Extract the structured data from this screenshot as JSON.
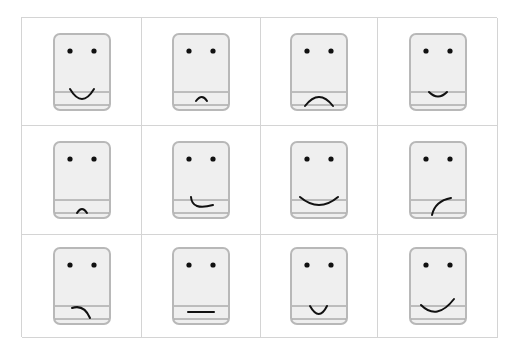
{
  "grid": {
    "rows": 3,
    "columns": 4,
    "cards": [
      {
        "mouth": "big-smile",
        "label": "face-1"
      },
      {
        "mouth": "small-frown",
        "label": "face-2"
      },
      {
        "mouth": "big-frown",
        "label": "face-3"
      },
      {
        "mouth": "small-smile",
        "label": "face-4"
      },
      {
        "mouth": "tiny-frown-low",
        "label": "face-5"
      },
      {
        "mouth": "lopsided-smile-right",
        "label": "face-6"
      },
      {
        "mouth": "wide-smile",
        "label": "face-7"
      },
      {
        "mouth": "curve-up-right",
        "label": "face-8"
      },
      {
        "mouth": "frown-right",
        "label": "face-9"
      },
      {
        "mouth": "flat-line",
        "label": "face-10"
      },
      {
        "mouth": "narrow-u",
        "label": "face-11"
      },
      {
        "mouth": "smile-up-right",
        "label": "face-12"
      }
    ]
  },
  "colors": {
    "card_fill": "#efefef",
    "card_border": "#b8b8b8",
    "lines": "#8a8a8a",
    "ink": "#111111",
    "grid_line": "#d4d4d4"
  }
}
